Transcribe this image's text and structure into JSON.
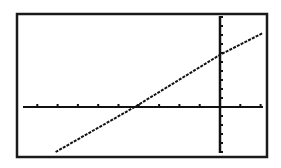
{
  "chart_data": {
    "type": "line",
    "title": "",
    "xlabel": "",
    "ylabel": "",
    "style": "graphing-calculator screen",
    "window": {
      "xmin": -10,
      "xmax": 2,
      "xscl": 1,
      "ymin": -5,
      "ymax": 10,
      "yscl": 1
    },
    "xlim": [
      -10,
      2
    ],
    "ylim": [
      -5,
      10
    ],
    "grid": false,
    "legend": null,
    "axes": {
      "x_ticks_every": 1,
      "y_ticks_every": 1,
      "tick_labels": false
    },
    "series": [
      {
        "name": "Y1",
        "equation_estimate": "y ≈ 1.3x + 5.8",
        "x_intercept": -4.2,
        "y_intercept": 5.8,
        "points": [
          {
            "x": -8.1,
            "y": -5
          },
          {
            "x": -4.2,
            "y": 0
          },
          {
            "x": 0,
            "y": 5.8
          },
          {
            "x": 2.1,
            "y": 8.2
          }
        ]
      }
    ]
  },
  "colors": {
    "background": "#ffffff",
    "ink": "#111111",
    "frame": "#1a1a1a"
  },
  "layout_px": {
    "frame": {
      "x": 17,
      "y": 14,
      "w": 250,
      "h": 143
    },
    "origin": {
      "x": 220,
      "y": 107
    },
    "x_unit_px": 20.3,
    "y_unit_px": 9.0,
    "x_axis": {
      "x1": 23,
      "x2": 263
    },
    "y_axis": {
      "y1": 16,
      "y2": 153
    }
  }
}
